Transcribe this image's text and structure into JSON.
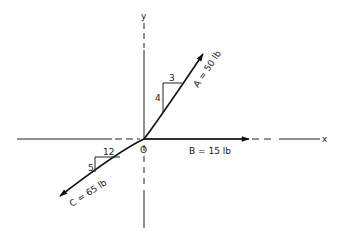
{
  "diagram": {
    "axes": {
      "x_label": "x",
      "y_label": "y",
      "origin_label": "O"
    },
    "vectors": [
      {
        "id": "A",
        "label": "A = 50 lb",
        "magnitude_lb": 50,
        "slope": {
          "rise": 4,
          "run": 3,
          "rise_label": "4",
          "run_label": "3"
        },
        "direction": "up-right"
      },
      {
        "id": "B",
        "label": "B = 15 lb",
        "magnitude_lb": 15,
        "direction": "along +x"
      },
      {
        "id": "C",
        "label": "C = 65 lb",
        "magnitude_lb": 65,
        "slope": {
          "rise": 5,
          "run": 12,
          "rise_label": "5",
          "run_label": "12"
        },
        "direction": "down-left"
      }
    ]
  }
}
